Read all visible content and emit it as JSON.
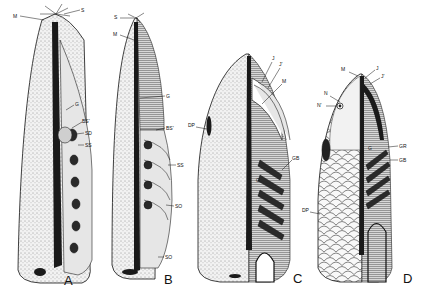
{
  "figure": {
    "panels": [
      {
        "id": "A",
        "label": "A",
        "structures": [
          "M",
          "S",
          "G",
          "BS'",
          "SD",
          "SS",
          "ST"
        ]
      },
      {
        "id": "B",
        "label": "B",
        "structures": [
          "S",
          "M",
          "G",
          "BS'",
          "SS",
          "SO",
          "SO"
        ]
      },
      {
        "id": "C",
        "label": "C",
        "structures": [
          "J",
          "J'",
          "M",
          "DP",
          "GB",
          "G"
        ]
      },
      {
        "id": "D",
        "label": "D",
        "structures": [
          "M",
          "J",
          "J'",
          "N",
          "N'",
          "GR",
          "GB",
          "G",
          "DP"
        ]
      }
    ]
  },
  "labels": {
    "A": {
      "M": "M",
      "S": "S",
      "G": "G",
      "BS": "BS'",
      "SD": "SD",
      "SS": "SS",
      "panel": "A"
    },
    "B": {
      "S": "S",
      "M": "M",
      "G": "G",
      "BS": "BS'",
      "SS": "SS",
      "SO1": "SO",
      "SO2": "SO",
      "panel": "B"
    },
    "C": {
      "J": "J",
      "J2": "J'",
      "M": "M",
      "DP": "DP",
      "GB": "GB",
      "G": "G",
      "panel": "C"
    },
    "D": {
      "M": "M",
      "J": "J",
      "J2": "J'",
      "N": "N",
      "N2": "N'",
      "G": "G",
      "GR": "GR",
      "GB": "GB",
      "DP": "DP",
      "panel": "D"
    }
  }
}
